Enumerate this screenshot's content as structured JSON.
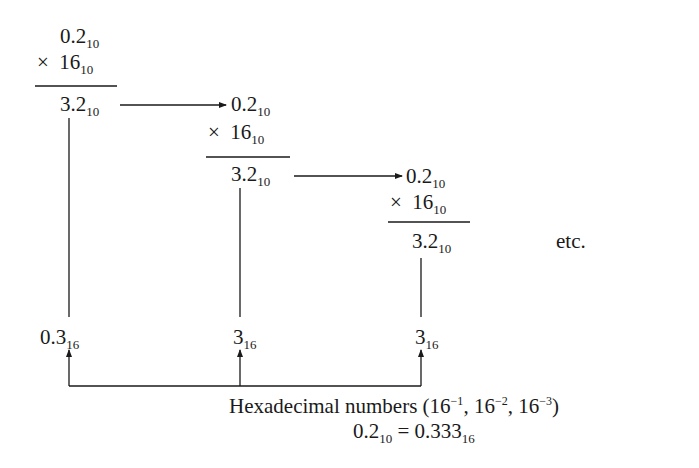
{
  "steps": [
    {
      "multiplicand": "0.2",
      "multiplicand_base": "10",
      "multiplier_sign": "×",
      "multiplier": "16",
      "multiplier_base": "10",
      "product": "3.2",
      "product_base": "10",
      "digit": "0.3",
      "digit_base": "16"
    },
    {
      "multiplicand": "0.2",
      "multiplicand_base": "10",
      "multiplier_sign": "×",
      "multiplier": "16",
      "multiplier_base": "10",
      "product": "3.2",
      "product_base": "10",
      "digit": "3",
      "digit_base": "16"
    },
    {
      "multiplicand": "0.2",
      "multiplicand_base": "10",
      "multiplier_sign": "×",
      "multiplier": "16",
      "multiplier_base": "10",
      "product": "3.2",
      "product_base": "10",
      "digit": "3",
      "digit_base": "16"
    }
  ],
  "etc_label": "etc.",
  "caption": {
    "line1_prefix": "Hexadecimal numbers (16",
    "exp1": "−1",
    "sep1": ", 16",
    "exp2": "−2",
    "sep2": ", 16",
    "exp3": "−3",
    "line1_suffix": ")",
    "line2_lhs": "0.2",
    "line2_lhs_base": "10",
    "line2_eq": " = ",
    "line2_rhs": "0.333",
    "line2_rhs_base": "16"
  },
  "colors": {
    "ink": "#1a1a1a",
    "background": "#ffffff"
  }
}
